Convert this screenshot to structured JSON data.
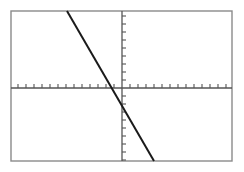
{
  "figure": {
    "name": "linear-function-graph",
    "background_color": "#ffffff",
    "frame": {
      "color": "#8a8a8a",
      "stroke_width": 1.4,
      "x": 11,
      "y": 11,
      "width": 221,
      "height": 150
    }
  },
  "chart_data": {
    "type": "line",
    "title": "",
    "xlabel": "",
    "ylabel": "",
    "grid": false,
    "legend": null,
    "axis_color": "#555555",
    "line_color": "#1a1a1a",
    "line_width": 2,
    "origin_px": {
      "x": 122,
      "y": 88
    },
    "unit_px": 8,
    "xlim": [
      -13.9,
      13.75
    ],
    "ylim": [
      -9.125,
      9.625
    ],
    "x_axis": {
      "pixel_y": 88,
      "pixel_x_start": 11,
      "pixel_x_end": 232,
      "tick_spacing_units": 1,
      "tick_length_px": 4,
      "tick_direction": "up",
      "tick_labels_shown": false,
      "tick_count_left": 13,
      "tick_count_right": 13
    },
    "y_axis": {
      "pixel_x": 122,
      "pixel_y_start": 11,
      "pixel_y_end": 161,
      "tick_spacing_units": 1,
      "tick_length_px": 4,
      "tick_direction": "right",
      "tick_labels_shown": false,
      "tick_count_above": 9,
      "tick_count_below": 9
    },
    "series": [
      {
        "name": "line-1",
        "equation": "y = -1.72x - 3.6",
        "slope": -1.72,
        "intercept": -3.6,
        "x_intercept": -2.09,
        "y_intercept": -3.6,
        "x": [
          -6.875,
          4.0
        ],
        "y": [
          9.625,
          -9.125
        ],
        "pixel_points": [
          {
            "x": 67,
            "y": 11
          },
          {
            "x": 154,
            "y": 161
          }
        ]
      }
    ]
  }
}
